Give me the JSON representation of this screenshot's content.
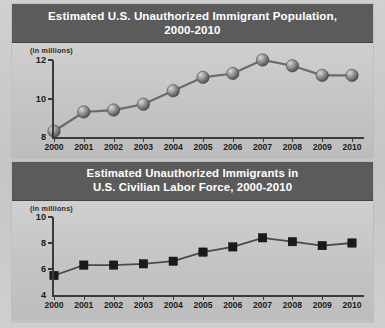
{
  "chart_data": [
    {
      "type": "line",
      "title_lines": [
        "Estimated U.S. Unauthorized Immigrant Population,",
        "2000-2010"
      ],
      "ylabel": "(in millions)",
      "xlabel": "",
      "categories": [
        "2000",
        "2001",
        "2002",
        "2003",
        "2004",
        "2005",
        "2006",
        "2007",
        "2008",
        "2009",
        "2010"
      ],
      "values": [
        8.3,
        9.3,
        9.4,
        9.7,
        10.4,
        11.1,
        11.3,
        12.0,
        11.7,
        11.2,
        11.2
      ],
      "ylim": [
        8,
        12
      ],
      "yticks": [
        8,
        10,
        12
      ],
      "grid": false,
      "legend": "none",
      "marker": "sphere",
      "line_color": "#6a6a6a"
    },
    {
      "type": "line",
      "title_lines": [
        "Estimated Unauthorized Immigrants in",
        "U.S. Civilian Labor Force, 2000-2010"
      ],
      "ylabel": "(in millions)",
      "xlabel": "",
      "categories": [
        "2000",
        "2001",
        "2002",
        "2003",
        "2004",
        "2005",
        "2006",
        "2007",
        "2008",
        "2009",
        "2010"
      ],
      "values": [
        5.5,
        6.3,
        6.3,
        6.4,
        6.6,
        7.3,
        7.7,
        8.4,
        8.1,
        7.8,
        8.0
      ],
      "ylim": [
        4,
        10
      ],
      "yticks": [
        4,
        6,
        8,
        10
      ],
      "grid": false,
      "legend": "none",
      "marker": "square",
      "line_color": "#4a4a4a"
    }
  ],
  "panels": {
    "top": {
      "title_line1": "Estimated U.S. Unauthorized Immigrant Population,",
      "title_line2": "2000-2010",
      "units": "(in millions)"
    },
    "bottom": {
      "title_line1": "Estimated Unauthorized Immigrants in",
      "title_line2": "U.S. Civilian Labor Force, 2000-2010",
      "units": "(in millions)"
    }
  },
  "colors": {
    "title_bar": "#5b5b5b",
    "title_text": "#ffffff",
    "plot_bg": "#c6c6c6",
    "axis": "#3a3a3a",
    "line_top": "#6a6a6a",
    "line_bottom": "#4a4a4a",
    "marker_bottom": "#1a1a1a"
  }
}
